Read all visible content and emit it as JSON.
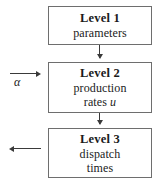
{
  "diagram": {
    "background_color": "#ffffff",
    "box_border_color": "#6e6e6e",
    "arrow_color": "#3a3a3a",
    "boxes": [
      {
        "id": "level-1",
        "title": "Level 1",
        "lines": [
          "parameters"
        ]
      },
      {
        "id": "level-2",
        "title": "Level 2",
        "lines": [
          "production",
          "rates"
        ],
        "variable": "u"
      },
      {
        "id": "level-3",
        "title": "Level 3",
        "lines": [
          "dispatch",
          "times"
        ]
      }
    ],
    "labels": {
      "alpha": "α"
    },
    "arrows": [
      {
        "id": "level1-to-level2",
        "direction": "down"
      },
      {
        "id": "level2-to-level3",
        "direction": "down"
      },
      {
        "id": "alpha-input",
        "direction": "right"
      },
      {
        "id": "level3-output",
        "direction": "left"
      }
    ]
  }
}
